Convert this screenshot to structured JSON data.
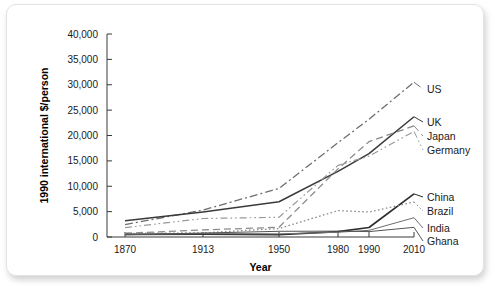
{
  "chart_data": {
    "type": "line",
    "title": "",
    "xlabel": "Year",
    "ylabel": "1990 international $/person",
    "x": [
      1870,
      1913,
      1950,
      1980,
      1990,
      2010
    ],
    "x_tick_labels": [
      "1870",
      "1913",
      "1950",
      "1980",
      "1990",
      "2010"
    ],
    "y_tick_labels": [
      "0",
      "5,000",
      "10,000",
      "15,000",
      "20,000",
      "25,000",
      "30,000",
      "35,000",
      "40,000"
    ],
    "y_ticks": [
      0,
      5000,
      10000,
      15000,
      20000,
      25000,
      30000,
      35000,
      40000
    ],
    "ylim": [
      0,
      40000
    ],
    "grid": false,
    "legend_position": "right-inline-labels",
    "axis_note": "x axis spacing is non-linear (unevenly spaced year ticks)",
    "series": [
      {
        "name": "US",
        "label": "US",
        "style": "dash-dot",
        "color": "#6e6e6e",
        "values": [
          2445,
          5301,
          9561,
          18577,
          23201,
          30500
        ]
      },
      {
        "name": "UK",
        "label": "UK",
        "style": "solid",
        "color": "#3a3a3a",
        "values": [
          3190,
          4921,
          6939,
          12931,
          16430,
          23700
        ]
      },
      {
        "name": "Japan",
        "label": "Japan",
        "style": "dashed",
        "color": "#8a8a8a",
        "values": [
          737,
          1387,
          1921,
          13428,
          18789,
          21900
        ]
      },
      {
        "name": "Germany",
        "label": "Germany",
        "style": "dash-dot-dot",
        "color": "#9a9a9a",
        "values": [
          1839,
          3648,
          3881,
          14114,
          15929,
          20800
        ]
      },
      {
        "name": "China",
        "label": "China",
        "style": "solid-thick",
        "color": "#2e2e2e",
        "values": [
          530,
          552,
          448,
          1061,
          1871,
          8500
        ]
      },
      {
        "name": "Brazil",
        "label": "Brazil",
        "style": "dotted",
        "color": "#8a8a8a",
        "values": [
          713,
          811,
          1672,
          5199,
          4920,
          6900
        ]
      },
      {
        "name": "India",
        "label": "India",
        "style": "solid-thin",
        "color": "#6e6e6e",
        "values": [
          533,
          673,
          619,
          938,
          1309,
          3800
        ]
      },
      {
        "name": "Ghana",
        "label": "Ghana",
        "style": "solid-thin",
        "color": "#555555",
        "values": [
          439,
          781,
          1122,
          1157,
          1063,
          1900
        ]
      }
    ]
  }
}
